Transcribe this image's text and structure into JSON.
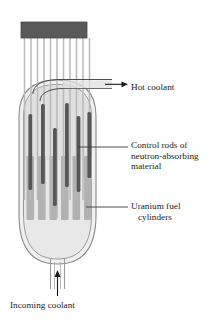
{
  "diagram": {
    "labels": {
      "hot_coolant": "Hot coolant",
      "control_rods_line1": "Control rods of",
      "control_rods_line2": "neutron-absorbing",
      "control_rods_line3": "material",
      "uranium_line1": "Uranium fuel",
      "uranium_line2": "cylinders",
      "incoming_coolant": "Incoming coolant"
    },
    "colors": {
      "background": "#ffffff",
      "drive_block": "#595959",
      "control_rod": "#585858",
      "control_rod_shaft": "#b3b3b3",
      "fuel_cylinder": "#b0b0b0",
      "vessel_outline": "#8a8a8a",
      "vessel_fill": "#ededed",
      "coolant_fill": "#e3e3e3",
      "leader_line": "#3a3a3a",
      "text": "#1a1a1a"
    },
    "counts": {
      "drive_shafts": 11,
      "control_rods": 6,
      "fuel_cylinders": 6
    }
  }
}
